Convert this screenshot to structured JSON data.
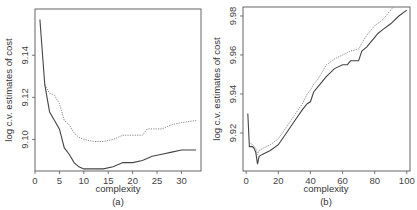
{
  "chart_data": [
    {
      "type": "line",
      "panel_label": "(a)",
      "title": "",
      "xlabel": "complexity",
      "ylabel": "log c.v. estimates of cost",
      "xlim": [
        0,
        34
      ],
      "ylim": [
        9.085,
        9.162
      ],
      "xticks": [
        0,
        5,
        10,
        15,
        20,
        25,
        30
      ],
      "yticks": [
        9.1,
        9.12,
        9.14
      ],
      "ytick_labels": [
        "9.10",
        "9.12",
        "9.14"
      ],
      "grid": false,
      "legend": null,
      "series": [
        {
          "name": "solid",
          "style": "solid",
          "x": [
            1,
            2,
            3,
            4,
            5,
            6,
            7,
            8,
            9,
            10,
            12,
            14,
            16,
            18,
            20,
            22,
            24,
            26,
            28,
            30,
            33
          ],
          "y": [
            9.157,
            9.126,
            9.113,
            9.109,
            9.105,
            9.096,
            9.093,
            9.089,
            9.087,
            9.086,
            9.086,
            9.086,
            9.087,
            9.089,
            9.089,
            9.09,
            9.092,
            9.093,
            9.094,
            9.095,
            9.095
          ]
        },
        {
          "name": "dotted",
          "style": "dotted",
          "x": [
            2,
            3,
            4,
            5,
            6,
            7,
            8,
            9,
            10,
            12,
            14,
            16,
            18,
            20,
            22,
            23,
            26,
            28,
            30,
            33
          ],
          "y": [
            9.126,
            9.122,
            9.121,
            9.117,
            9.109,
            9.107,
            9.103,
            9.101,
            9.1,
            9.099,
            9.099,
            9.1,
            9.102,
            9.102,
            9.102,
            9.105,
            9.105,
            9.107,
            9.108,
            9.109
          ]
        }
      ]
    },
    {
      "type": "line",
      "panel_label": "(b)",
      "title": "",
      "xlabel": "complexity",
      "ylabel": "log c.v. estimates of cost",
      "xlim": [
        -2,
        102
      ],
      "ylim": [
        9.9005,
        9.9846
      ],
      "xticks": [
        0,
        20,
        40,
        60,
        80,
        100
      ],
      "yticks": [
        9.92,
        9.94,
        9.96,
        9.98
      ],
      "ytick_labels": [
        "9.92",
        "9.94",
        "9.96",
        "9.98"
      ],
      "grid": false,
      "legend": null,
      "series": [
        {
          "name": "solid",
          "style": "solid",
          "x": [
            1,
            2,
            4,
            5,
            6,
            7,
            8,
            10,
            15,
            20,
            25,
            30,
            35,
            38,
            40,
            42,
            45,
            50,
            55,
            60,
            63,
            65,
            70,
            72,
            75,
            80,
            82,
            85,
            90,
            95,
            100
          ],
          "y": [
            9.93,
            9.913,
            9.913,
            9.912,
            9.91,
            9.904,
            9.908,
            9.909,
            9.911,
            9.914,
            9.92,
            9.926,
            9.932,
            9.935,
            9.936,
            9.941,
            9.944,
            9.949,
            9.953,
            9.955,
            9.955,
            9.957,
            9.957,
            9.962,
            9.964,
            9.969,
            9.971,
            9.973,
            9.976,
            9.98,
            9.983
          ]
        },
        {
          "name": "dotted",
          "style": "dotted",
          "x": [
            2,
            4,
            5,
            6,
            7,
            8,
            10,
            15,
            20,
            25,
            30,
            35,
            38,
            40,
            42,
            45,
            50,
            55,
            60,
            65,
            70,
            72,
            75,
            80,
            85,
            90,
            93
          ],
          "y": [
            9.915,
            9.914,
            9.913,
            9.912,
            9.909,
            9.911,
            9.912,
            9.914,
            9.917,
            9.923,
            9.929,
            9.935,
            9.94,
            9.942,
            9.945,
            9.948,
            9.955,
            9.958,
            9.96,
            9.962,
            9.963,
            9.966,
            9.97,
            9.975,
            9.978,
            9.983,
            9.986
          ]
        }
      ]
    }
  ]
}
